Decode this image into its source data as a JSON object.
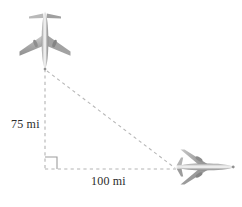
{
  "figure": {
    "background_color": "#ffffff",
    "width": 242,
    "height": 207
  },
  "labels": {
    "vertical_distance": "75 mi",
    "horizontal_distance": "100 mi",
    "text_color": "#2b2b2b"
  },
  "geometry": {
    "apex_vertex": {
      "x": 45,
      "y": 69
    },
    "right_angle_vertex": {
      "x": 45,
      "y": 169
    },
    "far_vertex": {
      "x": 176,
      "y": 169
    },
    "vertical_leg_label": "75 mi",
    "horizontal_leg_label": "100 mi",
    "right_angle_marker_size": 12,
    "line_style": "dashed",
    "line_color": "#b0b0b0",
    "line_width": 1
  },
  "objects": [
    {
      "name": "airplane-top",
      "orientation": "nose-up",
      "view": "top-down",
      "x": 18,
      "y": 12,
      "width": 54,
      "height": 58,
      "color_light": "#d8d8d8",
      "color_mid": "#a9a9a9",
      "color_dark": "#7d7d7d"
    },
    {
      "name": "airplane-right",
      "orientation": "nose-right",
      "view": "top-down",
      "x": 174,
      "y": 148,
      "width": 62,
      "height": 38,
      "color_light": "#d8d8d8",
      "color_mid": "#a9a9a9",
      "color_dark": "#7d7d7d"
    }
  ]
}
